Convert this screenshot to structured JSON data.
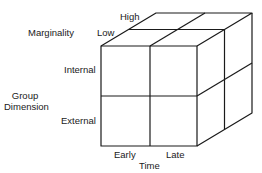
{
  "diagram": {
    "type": "3d-cube-2x2x2",
    "axes": {
      "marginality": {
        "title": "Marginality",
        "levels": [
          "Low",
          "High"
        ]
      },
      "group_dimension": {
        "title_line1": "Group",
        "title_line2": "Dimension",
        "levels": [
          "Internal",
          "External"
        ]
      },
      "time": {
        "title": "Time",
        "levels": [
          "Early",
          "Late"
        ]
      }
    },
    "line_color": "#1a1a1a"
  }
}
